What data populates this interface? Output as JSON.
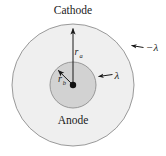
{
  "figure": {
    "name": "coaxial-cylinder-cross-section",
    "background_color": "#ffffff"
  },
  "labels": {
    "cathode": "Cathode",
    "anode": "Anode",
    "outer_charge": "−λ",
    "inner_charge": "λ",
    "outer_radius_symbol": "r",
    "outer_radius_subscript": "a",
    "inner_radius_symbol": "r",
    "inner_radius_subscript": "b"
  },
  "geometry": {
    "center_x": 73,
    "center_y": 85,
    "outer_radius": 61,
    "inner_radius": 23,
    "center_dot_radius": 3.2
  },
  "colors": {
    "outer_fill": "#efefef",
    "inner_fill": "#d2d2d2",
    "stroke": "#8a8a8a",
    "line": "#1a1a1a",
    "text": "#1a1a1a"
  },
  "annotations": {
    "outer_arrow_from_center_to_top": "r_a radius arrow pointing up to cathode",
    "inner_arrow_from_center_upleft": "r_b radius arrow pointing up-left to anode edge",
    "outer_charge_pointer": "arrow pointing to outer conductor",
    "inner_charge_pointer": "arrow pointing to inner conductor"
  }
}
